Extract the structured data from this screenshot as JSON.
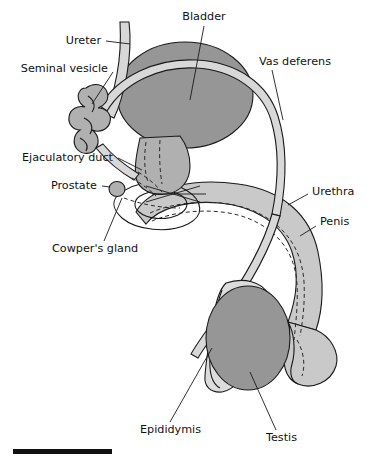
{
  "figure": {
    "background_color": "#ffffff",
    "labels": [
      {
        "id": "bladder",
        "text": "Bladder",
        "x": 204,
        "y": 17,
        "anchor": "middle"
      },
      {
        "id": "ureter",
        "text": "Ureter",
        "x": 101,
        "y": 41,
        "anchor": "end"
      },
      {
        "id": "seminal-vesicle",
        "text": "Seminal vesicle",
        "x": 108,
        "y": 69,
        "anchor": "end"
      },
      {
        "id": "vas-deferens",
        "text": "Vas deferens",
        "x": 259,
        "y": 62,
        "anchor": "start"
      },
      {
        "id": "ejaculatory-duct",
        "text": "Ejaculatory duct",
        "x": 113,
        "y": 158,
        "anchor": "end"
      },
      {
        "id": "prostate",
        "text": "Prostate",
        "x": 97,
        "y": 186,
        "anchor": "end"
      },
      {
        "id": "urethra",
        "text": "Urethra",
        "x": 312,
        "y": 192,
        "anchor": "start"
      },
      {
        "id": "penis",
        "text": "Penis",
        "x": 320,
        "y": 222,
        "anchor": "start"
      },
      {
        "id": "cowpers-gland",
        "text": "Cowper's gland",
        "x": 52,
        "y": 249,
        "anchor": "start"
      },
      {
        "id": "epididymis",
        "text": "Epididymis",
        "x": 140,
        "y": 430,
        "anchor": "start"
      },
      {
        "id": "testis",
        "text": "Testis",
        "x": 266,
        "y": 438,
        "anchor": "start"
      }
    ],
    "colors": {
      "organ_dark": "#969696",
      "organ_mid": "#b0b0b0",
      "organ_light": "#c9c9c9",
      "organ_pale": "#dcdcdc",
      "duct_tube": "#d8d8d8",
      "outline": "#1a1a1a",
      "text": "#111111",
      "scale_bar": "#111111"
    },
    "scale_bar": {
      "x": 13,
      "y": 449,
      "width": 99,
      "height": 5
    }
  }
}
